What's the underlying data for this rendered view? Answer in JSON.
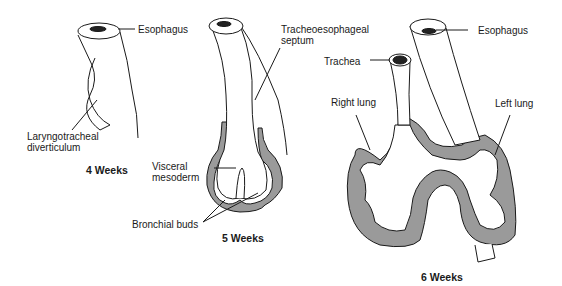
{
  "diagram": {
    "panels": [
      {
        "caption": "4 Weeks",
        "labels": {
          "esophagus": "Esophagus",
          "laryngotracheal_line1": "Laryngotracheal",
          "laryngotracheal_line2": "diverticulum"
        }
      },
      {
        "caption": "5 Weeks",
        "labels": {
          "septum_line1": "Tracheoesophageal",
          "septum_line2": "septum",
          "mesoderm_line1": "Visceral",
          "mesoderm_line2": "mesoderm",
          "buds": "Bronchial buds"
        }
      },
      {
        "caption": "6 Weeks",
        "labels": {
          "trachea": "Trachea",
          "esophagus": "Esophagus",
          "right_lung": "Right lung",
          "left_lung": "Left lung"
        }
      }
    ],
    "colors": {
      "mesoderm_fill": "#9a9a9a",
      "line": "#1a1a1a",
      "background": "#ffffff"
    }
  }
}
